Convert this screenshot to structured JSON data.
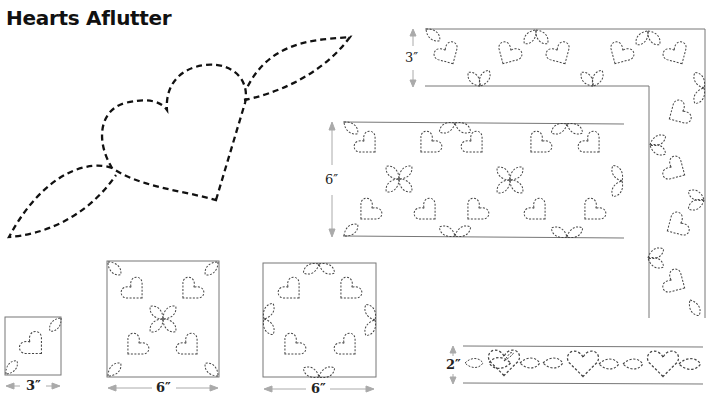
{
  "title": "Hearts Aflutter",
  "labels": {
    "corner_border_height": "3″",
    "wide_border_height": "6″",
    "small_block_width": "3″",
    "medium_block_width": "6″",
    "wreath_block_width": "6″",
    "narrow_border_height": "2″"
  },
  "colors": {
    "main_stitch": "#111111",
    "pattern_stitch": "#444444",
    "frame": "#777777",
    "arrow": "#aaaaaa"
  }
}
